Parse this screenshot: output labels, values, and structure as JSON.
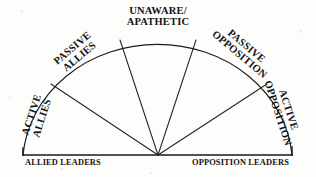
{
  "diagram": {
    "shape": "semicircle-fan",
    "ink_color": "#1b1b1b",
    "background_color": "#fdfdfc",
    "hub": {
      "x": 158,
      "y": 155
    },
    "radius": {
      "x": 135,
      "y": 121
    },
    "baseline": {
      "x1": 23,
      "x2": 292,
      "y": 155
    },
    "sectors": [
      {
        "id": "active-allies",
        "line1": "ACTIVE",
        "line2": "ALLIES",
        "rotation_deg": -72,
        "center": {
          "x": 37,
          "y": 117
        }
      },
      {
        "id": "passive-allies",
        "line1": "PASSIVE",
        "line2": "ALLIES",
        "rotation_deg": -40,
        "center": {
          "x": 76,
          "y": 53
        }
      },
      {
        "id": "unaware-apathetic",
        "line1": "UNAWARE/",
        "line2": "APATHETIC",
        "rotation_deg": 0,
        "center": {
          "x": 158,
          "y": 17
        }
      },
      {
        "id": "passive-opposition",
        "line1": "PASSIVE",
        "line2": "OPPOSITION",
        "rotation_deg": 40,
        "center": {
          "x": 243,
          "y": 51
        }
      },
      {
        "id": "active-opposition",
        "line1": "ACTIVE",
        "line2": "OPPOSITION",
        "rotation_deg": 72,
        "center": {
          "x": 283,
          "y": 112
        }
      }
    ],
    "axis_labels": {
      "left": "ALLIED LEADERS",
      "right": "OPPOSITION LEADERS"
    },
    "spokes": [
      {
        "id": "spoke-1",
        "angle_deg": 144,
        "endpoint": {
          "x": 51,
          "y": 84
        }
      },
      {
        "id": "spoke-2",
        "angle_deg": 108,
        "endpoint": {
          "x": 120,
          "y": 40
        }
      },
      {
        "id": "spoke-3",
        "angle_deg": 72,
        "endpoint": {
          "x": 196,
          "y": 40
        }
      },
      {
        "id": "spoke-4",
        "angle_deg": 36,
        "endpoint": {
          "x": 267,
          "y": 84
        }
      }
    ]
  }
}
